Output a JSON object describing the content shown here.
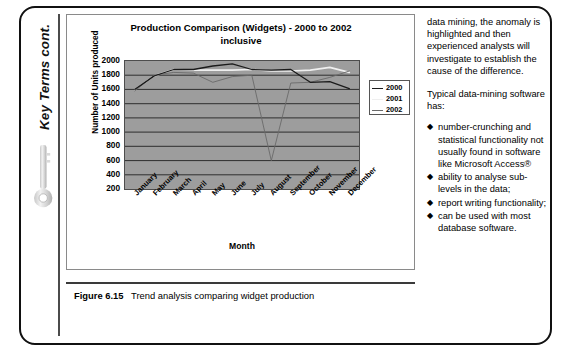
{
  "sidebar": {
    "title": "Key Terms cont.",
    "icon": "key-icon"
  },
  "figure": {
    "caption_number": "Figure 6.15",
    "caption_text": "Trend analysis comparing widget production"
  },
  "chart_data": {
    "type": "line",
    "title": "Production Comparison (Widgets) - 2000 to 2002 inclusive",
    "title_line1": "Production Comparison (Widgets) - 2000 to 2002",
    "title_line2": "inclusive",
    "xlabel": "Month",
    "ylabel": "Number of Units produced",
    "categories": [
      "January",
      "February",
      "March",
      "April",
      "May",
      "June",
      "July",
      "August",
      "September",
      "October",
      "November",
      "December"
    ],
    "ylim": [
      200,
      2000
    ],
    "ytick_labels": [
      "2000",
      "1800",
      "1600",
      "1400",
      "1200",
      "1000",
      "800",
      "600",
      "400",
      "200"
    ],
    "ytick_values": [
      2000,
      1800,
      1600,
      1400,
      1200,
      1000,
      800,
      600,
      400,
      200
    ],
    "grid": true,
    "legend_position": "right",
    "plot_background": "#9d9d9d",
    "series": [
      {
        "name": "2000",
        "color": "#1b1b1b",
        "values": [
          1600,
          1790,
          1880,
          1880,
          1930,
          1960,
          1880,
          1870,
          1880,
          1700,
          1710,
          1610
        ]
      },
      {
        "name": "2001",
        "color": "#efefef",
        "values": [
          1600,
          1790,
          1880,
          1870,
          1870,
          1870,
          1880,
          1860,
          1860,
          1870,
          1910,
          1840
        ]
      },
      {
        "name": "2002",
        "color": "#6a6a6a",
        "values": [
          1580,
          1800,
          1840,
          1830,
          1700,
          1780,
          1800,
          600,
          1690,
          1700,
          1770,
          1860
        ]
      }
    ]
  },
  "body_text": {
    "paragraph_1": "data mining, the anomaly is highlighted and then experienced analysts will investigate to establish the cause of the difference.",
    "paragraph_2": "Typical data-mining software has:",
    "bullet_glyph": "◆",
    "bullets": [
      "number-crunching and statistical functionality not usually found in software like Microsoft Access®",
      "ability to analyse sub-levels in the data;",
      "report writing functionality;",
      "can be used with most database software."
    ]
  }
}
